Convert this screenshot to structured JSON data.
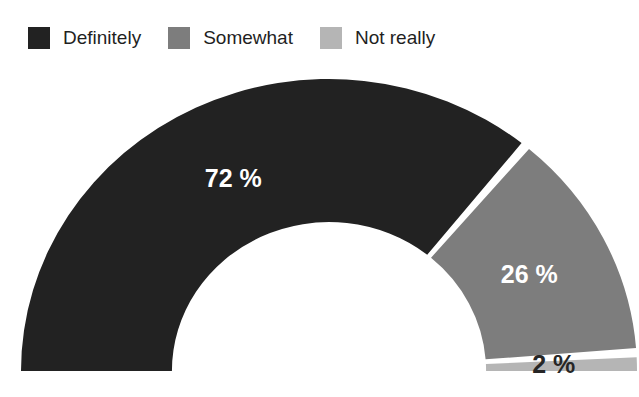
{
  "chart": {
    "legend": {
      "items": [
        {
          "label": "Definitely",
          "color": "#222222"
        },
        {
          "label": "Somewhat",
          "color": "#7d7d7d"
        },
        {
          "label": "Not really",
          "color": "#b5b5b5"
        }
      ]
    }
  },
  "chart_data": {
    "type": "pie",
    "variant": "half-donut-gauge",
    "categories": [
      "Definitely",
      "Somewhat",
      "Not really"
    ],
    "values": [
      72,
      26,
      2
    ],
    "unit": "%",
    "data_labels": [
      "72 %",
      "26 %",
      "2 %"
    ],
    "colors": [
      "#222222",
      "#7d7d7d",
      "#b5b5b5"
    ],
    "data_label_colors": [
      "#ffffff",
      "#ffffff",
      "#262626"
    ],
    "start_angle_deg": 180,
    "end_angle_deg": 0,
    "inner_radius_ratio": 0.51,
    "separator_color": "#ffffff",
    "background_color": "#ffffff",
    "legend_position": "top-left",
    "grid": false
  }
}
